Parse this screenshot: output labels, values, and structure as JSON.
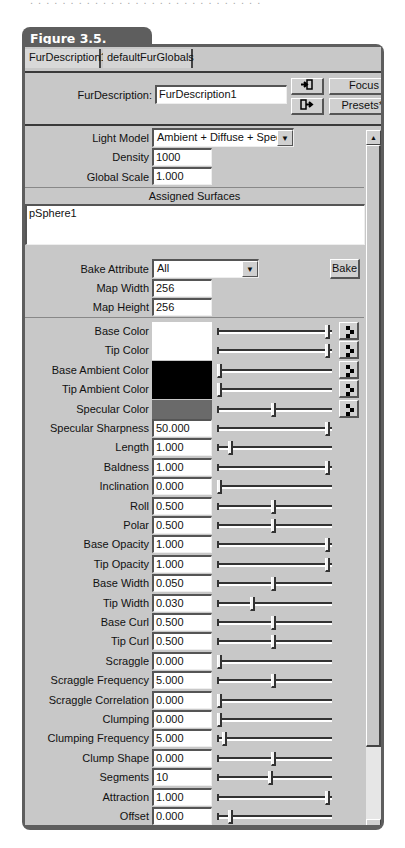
{
  "figure_label": "Figure 3.5.",
  "tabs": [
    {
      "label": "FurDescription1",
      "active": true
    },
    {
      "label": "defaultFurGlobals",
      "active": false
    }
  ],
  "header": {
    "name_label": "FurDescription:",
    "name_value": "FurDescription1",
    "focus_label": "Focus",
    "presets_label": "Presets*",
    "input_connections_icon": "input-connections-icon",
    "output_connections_icon": "output-connections-icon"
  },
  "general": {
    "light_model_label": "Light Model",
    "light_model_value": "Ambient + Diffuse + Specular",
    "density_label": "Density",
    "density_value": "1000",
    "global_scale_label": "Global Scale",
    "global_scale_value": "1.000"
  },
  "assigned_surfaces": {
    "title": "Assigned Surfaces",
    "items": [
      "pSphere1"
    ]
  },
  "bake": {
    "attribute_label": "Bake Attribute",
    "attribute_value": "All",
    "button_label": "Bake",
    "map_width_label": "Map Width",
    "map_width_value": "256",
    "map_height_label": "Map Height",
    "map_height_value": "256"
  },
  "colors": [
    {
      "label": "Base Color",
      "swatch": "#ffffff",
      "slider_pos": 1.0
    },
    {
      "label": "Tip Color",
      "swatch": "#ffffff",
      "slider_pos": 1.0
    },
    {
      "label": "Base Ambient Color",
      "swatch": "#000000",
      "slider_pos": 0.0
    },
    {
      "label": "Tip Ambient Color",
      "swatch": "#000000",
      "slider_pos": 0.0
    },
    {
      "label": "Specular Color",
      "swatch": "#6a6a6a",
      "slider_pos": 0.5
    }
  ],
  "attributes": [
    {
      "label": "Specular Sharpness",
      "value": "50.000",
      "slider_pos": 1.0
    },
    {
      "label": "Length",
      "value": "1.000",
      "slider_pos": 0.1
    },
    {
      "label": "Baldness",
      "value": "1.000",
      "slider_pos": 1.0
    },
    {
      "label": "Inclination",
      "value": "0.000",
      "slider_pos": 0.0
    },
    {
      "label": "Roll",
      "value": "0.500",
      "slider_pos": 0.5
    },
    {
      "label": "Polar",
      "value": "0.500",
      "slider_pos": 0.5
    },
    {
      "label": "Base Opacity",
      "value": "1.000",
      "slider_pos": 1.0
    },
    {
      "label": "Tip Opacity",
      "value": "1.000",
      "slider_pos": 1.0
    },
    {
      "label": "Base Width",
      "value": "0.050",
      "slider_pos": 0.5
    },
    {
      "label": "Tip Width",
      "value": "0.030",
      "slider_pos": 0.31
    },
    {
      "label": "Base Curl",
      "value": "0.500",
      "slider_pos": 0.5
    },
    {
      "label": "Tip Curl",
      "value": "0.500",
      "slider_pos": 0.5
    },
    {
      "label": "Scraggle",
      "value": "0.000",
      "slider_pos": 0.0
    },
    {
      "label": "Scraggle Frequency",
      "value": "5.000",
      "slider_pos": 0.5
    },
    {
      "label": "Scraggle Correlation",
      "value": "0.000",
      "slider_pos": 0.0
    },
    {
      "label": "Clumping",
      "value": "0.000",
      "slider_pos": 0.0
    },
    {
      "label": "Clumping Frequency",
      "value": "5.000",
      "slider_pos": 0.05
    },
    {
      "label": "Clump Shape",
      "value": "0.000",
      "slider_pos": 0.5
    },
    {
      "label": "Segments",
      "value": "10",
      "slider_pos": 0.47
    },
    {
      "label": "Attraction",
      "value": "1.000",
      "slider_pos": 1.0
    },
    {
      "label": "Offset",
      "value": "0.000",
      "slider_pos": 0.1
    }
  ],
  "scrollbar": {
    "up_arrow": "▲",
    "down_arrow": "▼"
  },
  "dropdown_arrow": "▼"
}
